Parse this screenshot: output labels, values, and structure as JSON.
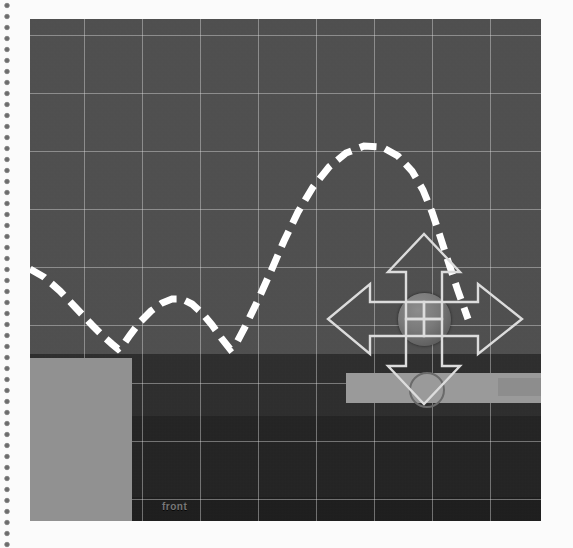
{
  "scene": {
    "title": "Physics Simulation Viewport",
    "floor_label": "front",
    "background_color": "#4f4f4f",
    "grid_color": "#e1e1e1",
    "trajectory_color": "#ffffff",
    "platform_color": "#919191",
    "ball_color": "#7a7a7a",
    "gizmo_color": "#dcdcdc"
  },
  "viewport": {
    "x": 30,
    "y": 19,
    "width": 511,
    "height": 502
  },
  "grid": {
    "cell_size_px": 58,
    "visible": true
  },
  "gizmo": {
    "name": "move-tool",
    "arrows": [
      "up",
      "down",
      "left",
      "right"
    ],
    "center_x": 394,
    "center_y": 300
  },
  "ball": {
    "name": "rigidbody-sphere",
    "center_x": 394,
    "center_y": 300,
    "radius": 26
  },
  "platforms": [
    {
      "name": "left-block",
      "x": -2,
      "y": 339,
      "width": 104,
      "height": 165
    },
    {
      "name": "right-bar",
      "x": 316,
      "y": 354,
      "width": 198,
      "height": 30
    }
  ],
  "chart_data": {
    "type": "line",
    "xlabel": "",
    "ylabel": "",
    "xlim": [
      0,
      511
    ],
    "ylim": [
      0,
      502
    ],
    "grid": true,
    "legend": "none",
    "style": "dashed",
    "series": [
      {
        "name": "ball-path",
        "points": [
          [
            0,
            250
          ],
          [
            14,
            258
          ],
          [
            30,
            272
          ],
          [
            46,
            289
          ],
          [
            62,
            306
          ],
          [
            74,
            318
          ],
          [
            82,
            325
          ],
          [
            88,
            330
          ],
          [
            93,
            326
          ],
          [
            100,
            316
          ],
          [
            110,
            303
          ],
          [
            121,
            292
          ],
          [
            132,
            284
          ],
          [
            142,
            280
          ],
          [
            152,
            280
          ],
          [
            162,
            285
          ],
          [
            172,
            294
          ],
          [
            182,
            306
          ],
          [
            192,
            320
          ],
          [
            200,
            330
          ],
          [
            206,
            325
          ],
          [
            216,
            306
          ],
          [
            228,
            281
          ],
          [
            241,
            252
          ],
          [
            254,
            222
          ],
          [
            268,
            193
          ],
          [
            283,
            168
          ],
          [
            299,
            148
          ],
          [
            316,
            134
          ],
          [
            334,
            127
          ],
          [
            352,
            128
          ],
          [
            368,
            137
          ],
          [
            382,
            152
          ],
          [
            393,
            171
          ],
          [
            402,
            193
          ],
          [
            410,
            217
          ],
          [
            419,
            245
          ],
          [
            428,
            272
          ],
          [
            438,
            300
          ]
        ]
      }
    ]
  }
}
